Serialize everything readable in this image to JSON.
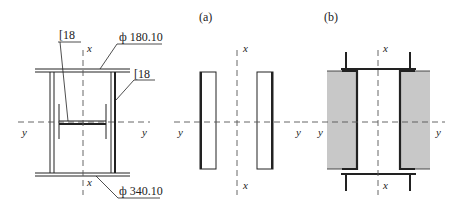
{
  "figure": {
    "panels": [
      {
        "id": "original",
        "label": ""
      },
      {
        "id": "a",
        "label": "(a)"
      },
      {
        "id": "b",
        "label": "(b)"
      }
    ],
    "annotations": {
      "channel_top": "[18",
      "channel_right": "[18",
      "plate_top": "ф 180.10",
      "plate_bottom": "ф 340.10"
    },
    "axes": {
      "x": "x",
      "y": "y"
    },
    "colors": {
      "line": "#222222",
      "shade": "#c8c8c8",
      "axis": "#555555"
    }
  }
}
